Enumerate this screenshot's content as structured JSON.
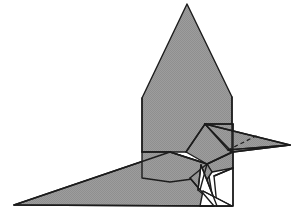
{
  "figure": {
    "title": "Origami folded paper bird",
    "subject": "bird",
    "view": "side profile facing right",
    "caption": "",
    "background_color": "#ffffff",
    "paper_fill_color": "#9a9a9a",
    "paper_fill_shadow_color": "#8e8e8e",
    "paper_fill_light_color": "#a6a6a6",
    "outline_color": "#1c1c1c",
    "hidden_fold_color": "#1c1c1c",
    "unfolded_flap_fill": "#ffffff",
    "canvas": {
      "width": 296,
      "height": 214
    }
  },
  "parts": {
    "wing": {
      "name": "wing",
      "fill": "#9a9a9a",
      "points": "187,4 142,98 142,152 232,152 232,97"
    },
    "tail": {
      "name": "tail",
      "fill": "#9a9a9a",
      "points": "14,205 170,152 207,164 214,206"
    },
    "body": {
      "name": "body",
      "fill": "#a0a0a0",
      "points": "142,152 170,152 207,164 200,178 170,182 142,178"
    },
    "neck": {
      "name": "neck",
      "fill": "#949494",
      "points": "205,124 232,152 207,164 186,152"
    },
    "head": {
      "name": "head",
      "fill": "#9e9e9e",
      "points": "205,124 233,124 233,152 232,152"
    },
    "head_lower": {
      "name": "head-lower-panel",
      "fill": "#979797",
      "points": "207,164 232,152 233,152 233,168 212,172"
    },
    "beak_upper": {
      "name": "beak-upper",
      "fill": "#9a9a9a",
      "points": "205,124 290,145 228,150"
    },
    "beak_lower": {
      "name": "beak-lower",
      "fill": "#8e8e8e",
      "points": "228,150 290,145 233,152"
    },
    "breast": {
      "name": "breast-panel",
      "fill": "#939393",
      "points": "207,164 212,172 200,190 190,178"
    },
    "leg_flap_left": {
      "name": "leg-flap-left",
      "fill": "#ffffff",
      "points": "201,165 217,206 198,190"
    },
    "leg_flap_right": {
      "name": "leg-flap-right",
      "fill": "#ffffff",
      "points": "203,191 232,206 200,206"
    },
    "foot_wedge": {
      "name": "foot-wedge",
      "fill": "#ffffff",
      "points": "214,176 233,168 233,206 217,206"
    }
  },
  "fold_lines": [
    {
      "name": "wing-left-crease",
      "path": "M142,98 L142,152"
    },
    {
      "name": "wing-right-crease",
      "path": "M232,97 L232,152"
    },
    {
      "name": "body-top-crease",
      "path": "M142,152 L170,152"
    },
    {
      "name": "tail-upper-crease",
      "path": "M14,205 L170,152"
    },
    {
      "name": "body-to-neck-crease",
      "path": "M170,152 L207,164"
    },
    {
      "name": "neck-front-crease",
      "path": "M205,124 L186,152"
    },
    {
      "name": "neck-back-crease",
      "path": "M205,124 L232,152"
    },
    {
      "name": "head-top-crease",
      "path": "M205,124 L233,124"
    },
    {
      "name": "head-back-crease",
      "path": "M233,124 L233,168"
    },
    {
      "name": "beak-center-crease",
      "path": "M205,124 L290,145"
    },
    {
      "name": "beak-lower-crease",
      "path": "M290,145 L233,152"
    },
    {
      "name": "chin-crease",
      "path": "M207,164 L233,152"
    },
    {
      "name": "breast-crease",
      "path": "M207,164 L200,190"
    },
    {
      "name": "belly-crease",
      "path": "M190,178 L214,206"
    },
    {
      "name": "tail-bottom-edge",
      "path": "M14,205 L214,206"
    }
  ],
  "hidden_folds": [
    {
      "name": "beak-hidden-crease",
      "path": "M228,150 L258,135"
    }
  ],
  "leg_lines": [
    {
      "name": "leg-front-line",
      "path": "M201,165 L217,206"
    },
    {
      "name": "leg-back-line",
      "path": "M198,190 L201,165"
    },
    {
      "name": "foot-line-lower",
      "path": "M200,206 L232,206"
    },
    {
      "name": "foot-line-diagonal",
      "path": "M203,191 L232,206"
    },
    {
      "name": "foot-line-upper",
      "path": "M214,176 L233,168"
    },
    {
      "name": "heel-line",
      "path": "M233,168 L233,206"
    }
  ]
}
